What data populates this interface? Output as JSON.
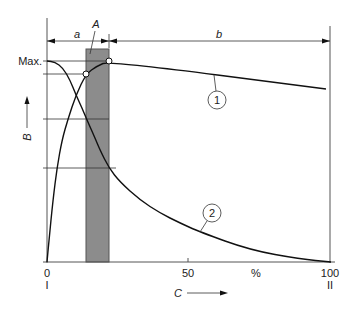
{
  "diagram": {
    "y_axis": {
      "label": "B",
      "max_label": "Max."
    },
    "x_axis": {
      "label": "C",
      "ticks": [
        {
          "value": "0",
          "sub": "I"
        },
        {
          "value": "50"
        },
        {
          "value": "%"
        },
        {
          "value": "100",
          "sub": "II"
        }
      ]
    },
    "regions": {
      "a_label": "a",
      "b_label": "b",
      "A_label": "A"
    },
    "curves": [
      {
        "id": "1",
        "label": "1",
        "points": [
          [
            47,
            262
          ],
          [
            49,
            240
          ],
          [
            53,
            200
          ],
          [
            57,
            168
          ],
          [
            62,
            140
          ],
          [
            68,
            119
          ],
          [
            76,
            95
          ],
          [
            86,
            74
          ],
          [
            97,
            66
          ],
          [
            109,
            61
          ],
          [
            326,
            89
          ]
        ]
      },
      {
        "id": "2",
        "label": "2",
        "points": [
          [
            47,
            61
          ],
          [
            55,
            62
          ],
          [
            63,
            68
          ],
          [
            70,
            80
          ],
          [
            76,
            95
          ],
          [
            82,
            108
          ],
          [
            87,
            120
          ],
          [
            95,
            138
          ],
          [
            100,
            150
          ],
          [
            109,
            168
          ],
          [
            120,
            182
          ],
          [
            140,
            200
          ],
          [
            160,
            213
          ],
          [
            180,
            223
          ],
          [
            200,
            232
          ],
          [
            250,
            250
          ],
          [
            300,
            259
          ],
          [
            331,
            262
          ]
        ]
      }
    ],
    "colors": {
      "shade": "#8c8c8c",
      "shade_edge": "#555555",
      "line": "#111111"
    }
  }
}
